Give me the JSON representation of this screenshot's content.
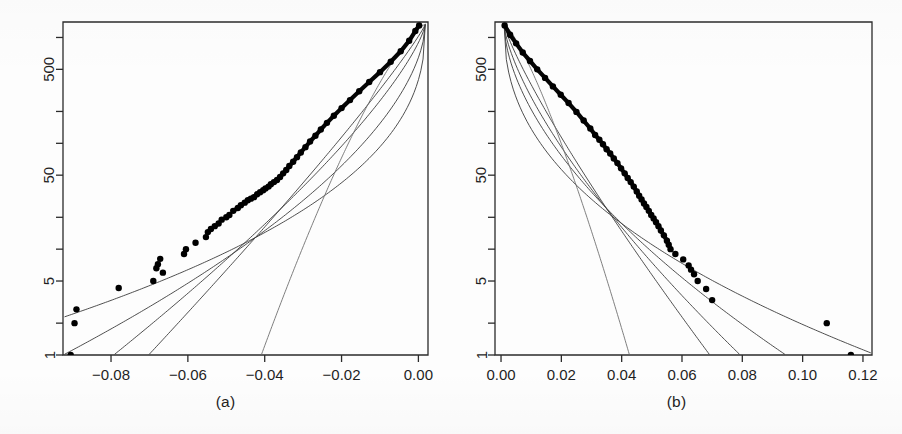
{
  "figure": {
    "title": "",
    "panel_count": 2,
    "background_color": "#ffffff",
    "ink_color": "#000000"
  },
  "panels": [
    {
      "id": "a",
      "caption": "(a)"
    },
    {
      "id": "b",
      "caption": "(b)"
    }
  ],
  "chart_data": [
    {
      "type": "scatter",
      "panel": "a",
      "title": "",
      "subtitle": "",
      "caption": "(a)",
      "xlabel": "",
      "ylabel": "",
      "xlim": [
        -0.0925,
        0.0025
      ],
      "ylim": [
        1,
        1400
      ],
      "yscale": "log",
      "xscale": "linear",
      "grid": false,
      "legend": null,
      "xticks": [
        -0.08,
        -0.06,
        -0.04,
        -0.02,
        0.0
      ],
      "xticklabels": [
        "-0.08",
        "-0.06",
        "-0.04",
        "-0.02",
        "0.00"
      ],
      "yticks": [
        1,
        5,
        50,
        500
      ],
      "yticklabels": [
        "1",
        "5",
        "50",
        "500"
      ],
      "yticks_minor": [
        2,
        10,
        20,
        100,
        200,
        1000
      ],
      "marker": "filled-circle",
      "marker_size_px": 3.2,
      "points": [
        [
          -0.0905,
          1.0
        ],
        [
          -0.0895,
          2.0
        ],
        [
          -0.089,
          2.7
        ],
        [
          -0.078,
          4.3
        ],
        [
          -0.069,
          5.0
        ],
        [
          -0.0682,
          6.6
        ],
        [
          -0.0678,
          7.2
        ],
        [
          -0.0672,
          8.1
        ],
        [
          -0.0665,
          6.0
        ],
        [
          -0.061,
          9.0
        ],
        [
          -0.0605,
          10.0
        ],
        [
          -0.058,
          11.5
        ],
        [
          -0.0553,
          13.0
        ],
        [
          -0.0548,
          14.5
        ],
        [
          -0.054,
          15.5
        ],
        [
          -0.053,
          16.5
        ],
        [
          -0.052,
          17.5
        ],
        [
          -0.0512,
          19.0
        ],
        [
          -0.05,
          20.0
        ],
        [
          -0.0492,
          21.0
        ],
        [
          -0.0482,
          23.0
        ],
        [
          -0.047,
          24.5
        ],
        [
          -0.0462,
          26.0
        ],
        [
          -0.0452,
          27.5
        ],
        [
          -0.0444,
          29.0
        ],
        [
          -0.0436,
          30.0
        ],
        [
          -0.0428,
          31.0
        ],
        [
          -0.042,
          33.0
        ],
        [
          -0.0412,
          34.5
        ],
        [
          -0.0404,
          36.0
        ],
        [
          -0.0398,
          37.5
        ],
        [
          -0.039,
          39.0
        ],
        [
          -0.0384,
          41.0
        ],
        [
          -0.0376,
          43.0
        ],
        [
          -0.0368,
          45.0
        ],
        [
          -0.036,
          48.0
        ],
        [
          -0.0352,
          52.0
        ],
        [
          -0.0344,
          56.0
        ],
        [
          -0.0336,
          61.0
        ],
        [
          -0.0326,
          67.0
        ],
        [
          -0.0316,
          74.0
        ],
        [
          -0.0306,
          82.0
        ],
        [
          -0.0294,
          92.0
        ],
        [
          -0.0282,
          104.0
        ],
        [
          -0.0268,
          118.0
        ],
        [
          -0.0254,
          135.0
        ],
        [
          -0.0238,
          156.0
        ],
        [
          -0.022,
          182.0
        ],
        [
          -0.02,
          215.0
        ],
        [
          -0.0178,
          256.0
        ],
        [
          -0.0154,
          310.0
        ],
        [
          -0.0128,
          380.0
        ],
        [
          -0.01,
          470.0
        ],
        [
          -0.0072,
          590.0
        ],
        [
          -0.0046,
          740.0
        ],
        [
          -0.0024,
          930.0
        ],
        [
          -0.0008,
          1150.0
        ],
        [
          0.0002,
          1300.0
        ]
      ],
      "fitted_curves": [
        {
          "name": "fit-1",
          "shade": "dark",
          "tail": "heaviest"
        },
        {
          "name": "fit-2",
          "shade": "dark",
          "tail": "heavy"
        },
        {
          "name": "fit-3",
          "shade": "mid",
          "tail": "moderate"
        },
        {
          "name": "fit-4",
          "shade": "mid",
          "tail": "light"
        },
        {
          "name": "fit-5",
          "shade": "faint",
          "tail": "lightest"
        }
      ],
      "notes": "Empirical quantiles (dots) with five fitted model curves converging at upper right near x = 0.00"
    },
    {
      "type": "scatter",
      "panel": "b",
      "title": "",
      "subtitle": "",
      "caption": "(b)",
      "xlabel": "",
      "ylabel": "",
      "xlim": [
        -0.002,
        0.123
      ],
      "ylim": [
        1,
        1400
      ],
      "yscale": "log",
      "xscale": "linear",
      "grid": false,
      "legend": null,
      "xticks": [
        0.0,
        0.02,
        0.04,
        0.06,
        0.08,
        0.1,
        0.12
      ],
      "xticklabels": [
        "0.00",
        "0.02",
        "0.04",
        "0.06",
        "0.08",
        "0.10",
        "0.12"
      ],
      "yticks": [
        1,
        5,
        50,
        500
      ],
      "yticklabels": [
        "1",
        "5",
        "50",
        "500"
      ],
      "yticks_minor": [
        2,
        10,
        20,
        100,
        200,
        1000
      ],
      "marker": "filled-circle",
      "marker_size_px": 3.2,
      "points": [
        [
          0.0012,
          1300.0
        ],
        [
          0.003,
          1060.0
        ],
        [
          0.005,
          880.0
        ],
        [
          0.0072,
          720.0
        ],
        [
          0.0096,
          600.0
        ],
        [
          0.012,
          500.0
        ],
        [
          0.0146,
          415.0
        ],
        [
          0.0172,
          345.0
        ],
        [
          0.0198,
          288.0
        ],
        [
          0.0224,
          240.0
        ],
        [
          0.025,
          198.0
        ],
        [
          0.0274,
          164.0
        ],
        [
          0.0296,
          138.0
        ],
        [
          0.0312,
          120.0
        ],
        [
          0.0326,
          108.0
        ],
        [
          0.0338,
          98.0
        ],
        [
          0.035,
          88.0
        ],
        [
          0.0362,
          80.0
        ],
        [
          0.0374,
          72.0
        ],
        [
          0.0386,
          65.0
        ],
        [
          0.0398,
          58.0
        ],
        [
          0.041,
          52.0
        ],
        [
          0.042,
          47.0
        ],
        [
          0.043,
          43.0
        ],
        [
          0.044,
          39.0
        ],
        [
          0.045,
          35.0
        ],
        [
          0.0458,
          32.0
        ],
        [
          0.0466,
          29.5
        ],
        [
          0.0474,
          27.0
        ],
        [
          0.0482,
          25.0
        ],
        [
          0.049,
          23.0
        ],
        [
          0.0498,
          21.0
        ],
        [
          0.0506,
          19.5
        ],
        [
          0.0514,
          18.0
        ],
        [
          0.0522,
          16.5
        ],
        [
          0.053,
          15.0
        ],
        [
          0.054,
          13.5
        ],
        [
          0.055,
          12.0
        ],
        [
          0.0556,
          11.0
        ],
        [
          0.0562,
          10.0
        ],
        [
          0.0578,
          9.0
        ],
        [
          0.0604,
          8.0
        ],
        [
          0.0622,
          7.0
        ],
        [
          0.063,
          6.4
        ],
        [
          0.064,
          5.8
        ],
        [
          0.0652,
          5.0
        ],
        [
          0.068,
          4.2
        ],
        [
          0.07,
          3.3
        ],
        [
          0.108,
          2.0
        ],
        [
          0.116,
          1.0
        ]
      ],
      "fitted_curves": [
        {
          "name": "fit-1",
          "shade": "dark",
          "tail": "heaviest"
        },
        {
          "name": "fit-2",
          "shade": "dark",
          "tail": "heavy"
        },
        {
          "name": "fit-3",
          "shade": "mid",
          "tail": "moderate"
        },
        {
          "name": "fit-4",
          "shade": "mid",
          "tail": "light"
        },
        {
          "name": "fit-5",
          "shade": "faint",
          "tail": "lightest"
        }
      ],
      "notes": "Empirical quantiles (dots) with five fitted model curves converging at upper left near x = 0.00; two far-right outliers"
    }
  ]
}
